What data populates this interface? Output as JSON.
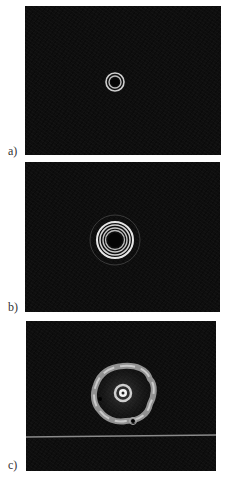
{
  "figure": {
    "panels": [
      {
        "label": "a)",
        "description": "Two concentric bright rings around a dark core",
        "rings": 2
      },
      {
        "label": "b)",
        "description": "Multiple concentric bright rings with faint outer halo",
        "rings": 4
      },
      {
        "label": "c)",
        "description": "Flower-like lobed intensity pattern with central bright spot and horizontal line artifact",
        "lobes": 6
      }
    ],
    "colors": {
      "background": "#ffffff",
      "panel": "#0e0e0e",
      "ring": "#d8d8d8",
      "label": "#333333"
    }
  }
}
